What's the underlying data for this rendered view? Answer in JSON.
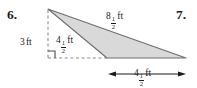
{
  "page": {
    "background_color": "#ffffff",
    "width": 197,
    "height": 88
  },
  "exercises": [
    {
      "number": "6."
    },
    {
      "number": "7."
    }
  ],
  "figure": {
    "type": "obtuse-triangle-with-altitude",
    "fill_color": "#d9d9d9",
    "stroke_color": "#6e6e6e",
    "dashed_color": "#8a8a8a",
    "shape": {
      "apex": {
        "x": 48,
        "y": 9
      },
      "bottom_left_vertex": {
        "x": 107,
        "y": 58
      },
      "bottom_right_vertex": {
        "x": 186,
        "y": 58
      },
      "foot_of_altitude": {
        "x": 48,
        "y": 58
      },
      "right_angle_marker": true
    },
    "labels": {
      "height": {
        "whole": "3",
        "unit": "ft",
        "text": "3 ft"
      },
      "hypotenuse": {
        "whole": "8",
        "numerator": "1",
        "denominator": "2",
        "unit": "ft",
        "text": "8 1/2 ft"
      },
      "slant": {
        "whole": "4",
        "numerator": "1",
        "denominator": "2",
        "unit": "ft",
        "text": "4 1/2 ft"
      },
      "base": {
        "whole": "4",
        "numerator": "1",
        "denominator": "2",
        "unit": "ft",
        "text": "4 1/2 ft"
      }
    },
    "dimension_line": {
      "from_x": 108,
      "to_x": 186,
      "y": 74,
      "arrows": "both"
    }
  }
}
